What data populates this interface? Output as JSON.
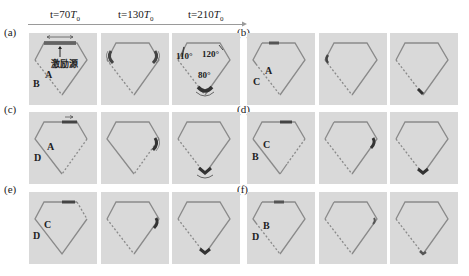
{
  "header": {
    "times": [
      {
        "prefix": "t=",
        "value": "70",
        "unit": "T",
        "sub": "0"
      },
      {
        "prefix": "t=",
        "value": "130",
        "unit": "T",
        "sub": "0"
      },
      {
        "prefix": "t=",
        "value": "210",
        "unit": "T",
        "sub": "0"
      }
    ]
  },
  "colors": {
    "panel_bg": "#d9d9d9",
    "outline": "#8a8a8a",
    "wave": "#4a4a4a",
    "axis": "#9a9a9a"
  },
  "groups": [
    {
      "label": "(a)",
      "points": [
        "A",
        "B"
      ],
      "source_label": "激励源",
      "angles": [
        "110°",
        "120°",
        "80°"
      ]
    },
    {
      "label": "(b)",
      "points": [
        "A",
        "C"
      ]
    },
    {
      "label": "(c)",
      "points": [
        "A",
        "D"
      ]
    },
    {
      "label": "(d)",
      "points": [
        "C",
        "B"
      ]
    },
    {
      "label": "(e)",
      "points": [
        "C",
        "D"
      ]
    },
    {
      "label": "(f)",
      "points": [
        "B",
        "D"
      ]
    }
  ]
}
